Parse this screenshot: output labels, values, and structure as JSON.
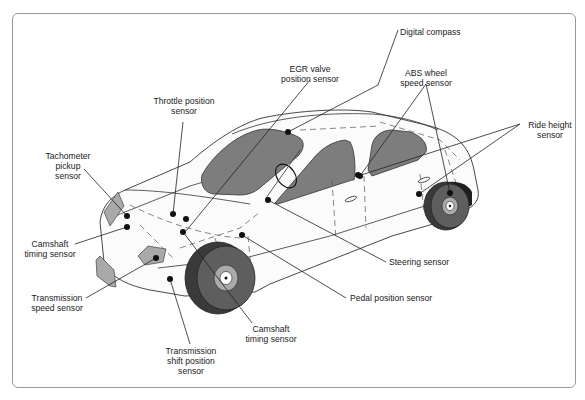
{
  "diagram": {
    "labels": {
      "digital_compass": "Digital compass",
      "egr_valve_1": "EGR valve",
      "egr_valve_2": "position sensor",
      "abs_1": "ABS wheel",
      "abs_2": "speed sensor",
      "throttle_1": "Throttle position",
      "throttle_2": "sensor",
      "ride_height_1": "Ride height",
      "ride_height_2": "sensor",
      "tachometer_1": "Tachometer",
      "tachometer_2": "pickup",
      "tachometer_3": "sensor",
      "camshaft_left_1": "Camshaft",
      "camshaft_left_2": "timing sensor",
      "steering": "Steering sensor",
      "transmission_speed_1": "Transmission",
      "transmission_speed_2": "speed sensor",
      "pedal_position": "Pedal position sensor",
      "camshaft_bottom_1": "Camshaft",
      "camshaft_bottom_2": "timing sensor",
      "trans_shift_1": "Transmission",
      "trans_shift_2": "shift position",
      "trans_shift_3": "sensor"
    },
    "colors": {
      "glass": "#7d7d7d",
      "tire": "#3a3a3a",
      "rim": "#aaaaaa",
      "frame_border": "#9a9a9a"
    }
  }
}
